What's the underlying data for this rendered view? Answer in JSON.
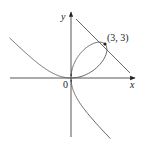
{
  "figure": {
    "curve_equation": "x^3 + y^3 = 6xy",
    "tangent_equation": "x + y = 6",
    "labels": {
      "x_axis": "x",
      "y_axis": "y",
      "origin": "0",
      "point": "(3, 3)"
    },
    "point": {
      "x": 3,
      "y": 3
    },
    "colors": {
      "curve": "#555555",
      "axes": "#444444",
      "tangent": "#555555",
      "point": "#222222",
      "background": "#ffffff"
    }
  }
}
